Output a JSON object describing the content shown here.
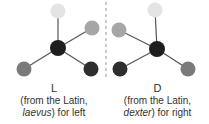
{
  "left": {
    "letter": "L",
    "line1": "(from the Latin,",
    "latin_word": "laevus",
    "line2_suffix": ") for left"
  },
  "right": {
    "letter": "D",
    "line1": "(from the Latin,",
    "latin_word": "dexter",
    "line2_suffix": ") for right"
  },
  "colors": {
    "center": "#1e1e1e",
    "top": "#e4e4e4",
    "light_gray": "#a6a6a6",
    "mid_gray": "#7a7a7a",
    "dark": "#2e2e2e",
    "bond": "#555555",
    "divider": "#999999"
  }
}
